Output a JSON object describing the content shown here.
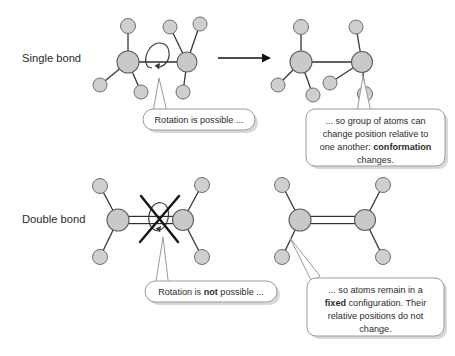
{
  "figure": {
    "background_color": "#ffffff",
    "atom_fill": "#cfcfd1",
    "atom_stroke": "#6e6e70",
    "bond_color": "#2e2e30",
    "text_color": "#2b2b2b",
    "bubble_stroke": "#9a9a9c"
  },
  "rows": {
    "single": {
      "label": "Single bond"
    },
    "double": {
      "label": "Double bond"
    }
  },
  "callouts": {
    "rotation_possible": {
      "lines": [
        [
          {
            "t": "Rotation is possible ...",
            "bold": false
          }
        ]
      ]
    },
    "conformation_changes": {
      "lines": [
        [
          {
            "t": "... so group of atoms can",
            "bold": false
          }
        ],
        [
          {
            "t": "change position relative to",
            "bold": false
          }
        ],
        [
          {
            "t": "one another: ",
            "bold": false
          },
          {
            "t": "conformation",
            "bold": true
          }
        ],
        [
          {
            "t": "changes.",
            "bold": false
          }
        ]
      ]
    },
    "rotation_not_possible": {
      "lines": [
        [
          {
            "t": "Rotation is ",
            "bold": false
          },
          {
            "t": "not",
            "bold": true
          },
          {
            "t": " possible ...",
            "bold": false
          }
        ]
      ]
    },
    "fixed_configuration": {
      "lines": [
        [
          {
            "t": "... so atoms remain in a",
            "bold": false
          }
        ],
        [
          {
            "t": "fixed",
            "bold": true
          },
          {
            "t": " configuration. Their",
            "bold": false
          }
        ],
        [
          {
            "t": "relative positions do not",
            "bold": false
          }
        ],
        [
          {
            "t": "change.",
            "bold": false
          }
        ]
      ]
    }
  },
  "structures": {
    "single_before": {
      "name": "ethane-staggered-before-rotation",
      "carbons": [
        {
          "x": 128,
          "y": 62,
          "r": 11
        },
        {
          "x": 187,
          "y": 62,
          "r": 10
        }
      ],
      "substituents": [
        {
          "x": 128,
          "y": 26,
          "r": 7.5,
          "from": 0
        },
        {
          "x": 100,
          "y": 85,
          "r": 7,
          "from": 0
        },
        {
          "x": 141,
          "y": 92,
          "r": 7,
          "from": 0
        },
        {
          "x": 170,
          "y": 27,
          "r": 7,
          "from": 1
        },
        {
          "x": 200,
          "y": 24,
          "r": 7,
          "from": 1
        },
        {
          "x": 183,
          "y": 92,
          "r": 7,
          "from": 1
        }
      ]
    },
    "single_after": {
      "name": "ethane-staggered-after-rotation",
      "carbons": [
        {
          "x": 301,
          "y": 62,
          "r": 11
        },
        {
          "x": 362,
          "y": 62,
          "r": 10.5
        }
      ],
      "substituents": [
        {
          "x": 301,
          "y": 27,
          "r": 7.5,
          "from": 0
        },
        {
          "x": 278,
          "y": 85,
          "r": 7,
          "from": 0
        },
        {
          "x": 313,
          "y": 95,
          "r": 7,
          "from": 0
        },
        {
          "x": 356,
          "y": 27,
          "r": 7,
          "from": 1
        },
        {
          "x": 330,
          "y": 83,
          "r": 7,
          "from": 1
        },
        {
          "x": 365,
          "y": 94,
          "r": 7.5,
          "from": 1
        }
      ]
    },
    "double_left": {
      "name": "alkene-rotation-blocked",
      "carbons": [
        {
          "x": 118,
          "y": 220,
          "r": 11
        },
        {
          "x": 183,
          "y": 220,
          "r": 10.5
        }
      ],
      "substituents": [
        {
          "x": 100,
          "y": 186,
          "r": 7.5,
          "from": 0
        },
        {
          "x": 100,
          "y": 257,
          "r": 7.5,
          "from": 0
        },
        {
          "x": 202,
          "y": 185,
          "r": 7.5,
          "from": 1
        },
        {
          "x": 202,
          "y": 257,
          "r": 7.5,
          "from": 1
        }
      ]
    },
    "double_right": {
      "name": "alkene-fixed-configuration",
      "carbons": [
        {
          "x": 300,
          "y": 220,
          "r": 11
        },
        {
          "x": 365,
          "y": 220,
          "r": 10.5
        }
      ],
      "substituents": [
        {
          "x": 282,
          "y": 185,
          "r": 7.5,
          "from": 0
        },
        {
          "x": 282,
          "y": 257,
          "r": 7.5,
          "from": 0
        },
        {
          "x": 383,
          "y": 185,
          "r": 7.5,
          "from": 1
        },
        {
          "x": 383,
          "y": 257,
          "r": 7.5,
          "from": 1
        }
      ]
    }
  },
  "arrow": {
    "name": "transformation-arrow",
    "x1": 218,
    "y1": 58,
    "x2": 268,
    "y2": 58
  }
}
